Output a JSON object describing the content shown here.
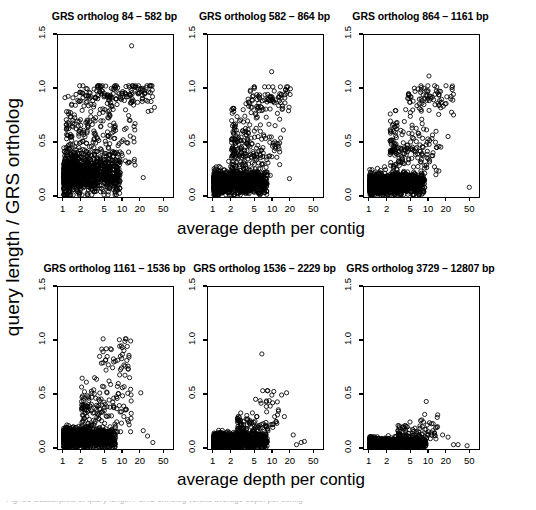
{
  "figure": {
    "xlabel": "average depth per contig",
    "ylabel": "query length / GRS ortholog",
    "caption_clipped": "Fig. S5 Scatterplots of query length / GRS ortholog versus average depth per contig"
  },
  "chart_data": {
    "type": "scatter",
    "title": "",
    "xlabel": "average depth per contig",
    "ylabel": "query length / GRS ortholog",
    "xscale": "log",
    "xlim": [
      0.8,
      70
    ],
    "ylim": [
      0.0,
      1.5
    ],
    "xticks": [
      1,
      2,
      5,
      10,
      20,
      50
    ],
    "xticklabels": [
      "1",
      "2",
      "5",
      "10",
      "20",
      "50"
    ],
    "yticks": [
      0.0,
      0.5,
      1.0,
      1.5
    ],
    "yticklabels": [
      "0.0",
      "0.5",
      "1.0",
      "1.5"
    ],
    "grid": false,
    "legend": null,
    "marker": "open-circle",
    "marker_color": "#000000",
    "panels": [
      {
        "title": "GRS ortholog 84 – 582 bp",
        "row": 0,
        "col": 0,
        "n_points": 1450,
        "seed": 11,
        "core": {
          "n": 1040,
          "x_lo": 1.0,
          "x_hi": 9.0,
          "y_mu": 0.21,
          "y_sd": 0.085,
          "y_min": 0.02,
          "y_max": 0.5
        },
        "mid": {
          "n": 250,
          "x_lo": 1.1,
          "x_hi": 16.0,
          "y_mu": 0.55,
          "y_sd": 0.17,
          "y_min": 0.25,
          "y_max": 0.95
        },
        "arc": {
          "n": 150,
          "x_lo": 1.8,
          "x_hi": 32.0,
          "y_mu": 0.95,
          "y_sd": 0.06,
          "y_min": 0.72,
          "y_max": 1.03
        },
        "outliers": [
          {
            "x": 14.0,
            "y": 1.4
          },
          {
            "x": 1.05,
            "y": 0.92
          },
          {
            "x": 22.0,
            "y": 0.18
          },
          {
            "x": 34.0,
            "y": 0.83
          },
          {
            "x": 30.0,
            "y": 0.8
          }
        ]
      },
      {
        "title": "GRS ortholog 582 – 864 bp",
        "row": 0,
        "col": 1,
        "n_points": 1380,
        "seed": 23,
        "core": {
          "n": 1060,
          "x_lo": 1.0,
          "x_hi": 8.0,
          "y_mu": 0.14,
          "y_sd": 0.055,
          "y_min": 0.02,
          "y_max": 0.33
        },
        "mid": {
          "n": 230,
          "x_lo": 2.0,
          "x_hi": 14.0,
          "y_mu": 0.45,
          "y_sd": 0.16,
          "y_min": 0.2,
          "y_max": 0.82
        },
        "arc": {
          "n": 90,
          "x_lo": 3.5,
          "x_hi": 20.0,
          "y_mu": 0.92,
          "y_sd": 0.07,
          "y_min": 0.72,
          "y_max": 1.02
        },
        "outliers": [
          {
            "x": 9.5,
            "y": 1.16
          },
          {
            "x": 15.0,
            "y": 0.62
          },
          {
            "x": 19.0,
            "y": 0.17
          },
          {
            "x": 13.0,
            "y": 0.3
          }
        ]
      },
      {
        "title": "GRS ortholog 864 – 1161 bp",
        "row": 0,
        "col": 2,
        "n_points": 1320,
        "seed": 37,
        "core": {
          "n": 1050,
          "x_lo": 1.0,
          "x_hi": 8.5,
          "y_mu": 0.12,
          "y_sd": 0.05,
          "y_min": 0.02,
          "y_max": 0.28
        },
        "mid": {
          "n": 190,
          "x_lo": 2.2,
          "x_hi": 16.0,
          "y_mu": 0.44,
          "y_sd": 0.16,
          "y_min": 0.2,
          "y_max": 0.8
        },
        "arc": {
          "n": 80,
          "x_lo": 4.0,
          "x_hi": 26.0,
          "y_mu": 0.93,
          "y_sd": 0.07,
          "y_min": 0.72,
          "y_max": 1.03
        },
        "outliers": [
          {
            "x": 10.0,
            "y": 1.12
          },
          {
            "x": 48.0,
            "y": 0.09
          },
          {
            "x": 26.0,
            "y": 0.76
          },
          {
            "x": 21.0,
            "y": 0.56
          }
        ]
      },
      {
        "title": "GRS ortholog 1161 – 1536 bp",
        "row": 1,
        "col": 0,
        "n_points": 1300,
        "seed": 51,
        "core": {
          "n": 1090,
          "x_lo": 1.0,
          "x_hi": 7.5,
          "y_mu": 0.1,
          "y_sd": 0.045,
          "y_min": 0.02,
          "y_max": 0.24
        },
        "mid": {
          "n": 160,
          "x_lo": 2.0,
          "x_hi": 14.0,
          "y_mu": 0.35,
          "y_sd": 0.14,
          "y_min": 0.16,
          "y_max": 0.66
        },
        "arc": {
          "n": 45,
          "x_lo": 4.0,
          "x_hi": 13.0,
          "y_mu": 0.82,
          "y_sd": 0.11,
          "y_min": 0.58,
          "y_max": 1.02
        },
        "outliers": [
          {
            "x": 11.0,
            "y": 1.02
          },
          {
            "x": 13.5,
            "y": 1.0
          },
          {
            "x": 20.0,
            "y": 0.52
          },
          {
            "x": 26.0,
            "y": 0.12
          },
          {
            "x": 32.0,
            "y": 0.06
          },
          {
            "x": 22.0,
            "y": 0.17
          }
        ]
      },
      {
        "title": "GRS ortholog 1536 – 2229 bp",
        "row": 1,
        "col": 1,
        "n_points": 1260,
        "seed": 67,
        "core": {
          "n": 1120,
          "x_lo": 1.0,
          "x_hi": 8.0,
          "y_mu": 0.07,
          "y_sd": 0.035,
          "y_min": 0.01,
          "y_max": 0.18
        },
        "mid": {
          "n": 110,
          "x_lo": 2.5,
          "x_hi": 12.0,
          "y_mu": 0.2,
          "y_sd": 0.06,
          "y_min": 0.12,
          "y_max": 0.34
        },
        "arc": {
          "n": 22,
          "x_lo": 5.0,
          "x_hi": 16.0,
          "y_mu": 0.42,
          "y_sd": 0.07,
          "y_min": 0.3,
          "y_max": 0.54
        },
        "outliers": [
          {
            "x": 6.5,
            "y": 0.88
          },
          {
            "x": 17.0,
            "y": 0.52
          },
          {
            "x": 14.0,
            "y": 0.5
          },
          {
            "x": 22.0,
            "y": 0.13
          },
          {
            "x": 30.0,
            "y": 0.06
          },
          {
            "x": 34.0,
            "y": 0.07
          },
          {
            "x": 25.0,
            "y": 0.04
          }
        ]
      },
      {
        "title": "GRS ortholog 3729 – 12807 bp",
        "row": 1,
        "col": 2,
        "n_points": 1240,
        "seed": 83,
        "core": {
          "n": 1140,
          "x_lo": 1.0,
          "x_hi": 9.0,
          "y_mu": 0.05,
          "y_sd": 0.025,
          "y_min": 0.01,
          "y_max": 0.13
        },
        "mid": {
          "n": 85,
          "x_lo": 3.0,
          "x_hi": 14.0,
          "y_mu": 0.14,
          "y_sd": 0.05,
          "y_min": 0.08,
          "y_max": 0.25
        },
        "arc": {
          "n": 14,
          "x_lo": 6.0,
          "x_hi": 16.0,
          "y_mu": 0.25,
          "y_sd": 0.04,
          "y_min": 0.18,
          "y_max": 0.32
        },
        "outliers": [
          {
            "x": 9.0,
            "y": 0.44
          },
          {
            "x": 17.0,
            "y": 0.13
          },
          {
            "x": 21.0,
            "y": 0.11
          },
          {
            "x": 26.0,
            "y": 0.04
          },
          {
            "x": 31.0,
            "y": 0.04
          },
          {
            "x": 44.0,
            "y": 0.03
          }
        ]
      }
    ]
  }
}
